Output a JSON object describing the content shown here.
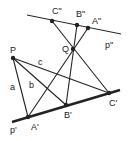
{
  "diagram": {
    "title": "",
    "colors": {
      "stroke": "#222222",
      "background": "#ffffff"
    },
    "points": {
      "P": {
        "label": "P",
        "x": 13,
        "y": 58
      },
      "Q": {
        "label": "Q",
        "x": 73,
        "y": 49
      },
      "A1": {
        "label": "A'",
        "x": 28,
        "y": 117
      },
      "B1": {
        "label": "B'",
        "x": 66,
        "y": 105
      },
      "C1": {
        "label": "C'",
        "x": 109,
        "y": 93
      },
      "A2": {
        "label": "A\"",
        "x": 88,
        "y": 28
      },
      "B2": {
        "label": "B\"",
        "x": 77,
        "y": 25
      },
      "C2": {
        "label": "C\"",
        "x": 52,
        "y": 21
      }
    },
    "lines": {
      "p1": {
        "label": "p'",
        "from": [
          12,
          122
        ],
        "to": [
          120,
          90
        ],
        "weight": "thick"
      },
      "p2": {
        "label": "p\"",
        "from": [
          27,
          15
        ],
        "to": [
          121,
          34
        ],
        "weight": "thin"
      },
      "a": {
        "label": "a"
      },
      "b": {
        "label": "b"
      },
      "c": {
        "label": "c"
      }
    }
  }
}
